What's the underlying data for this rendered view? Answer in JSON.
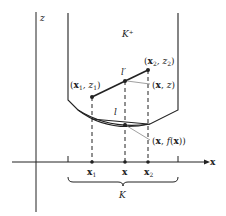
{
  "diagram": {
    "axis_labels": {
      "z": "z",
      "x": "x"
    },
    "region_labels": {
      "epigraph": "K⁺",
      "domain": "K"
    },
    "points": {
      "p1": {
        "bold": "x",
        "sub": "1",
        "rest": ", z",
        "sub2": "1",
        "label": "(x1, z1)"
      },
      "p2": {
        "bold": "x",
        "sub": "2",
        "rest": ", z",
        "sub2": "2",
        "label": "(x2, z2)"
      },
      "pxz": {
        "label": "(x, z)"
      },
      "pfx": {
        "label": "(x, f(x))"
      }
    },
    "line_labels": {
      "upper": "l′",
      "lower": "l"
    },
    "ticks": {
      "x1": "x",
      "x1_sub": "1",
      "x": "x",
      "x2": "x",
      "x2_sub": "2"
    },
    "colors": {
      "ink": "#222222",
      "leader": "#888888"
    }
  }
}
